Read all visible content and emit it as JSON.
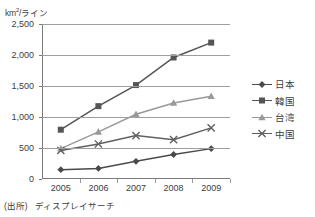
{
  "axis_title": {
    "text": "km2/ライン",
    "unit_base": "km",
    "unit_sup": "2",
    "unit_rest": "/ライン"
  },
  "source_note": {
    "prefix": "(出所)",
    "name": "ディスプレイサーチ"
  },
  "legend": {
    "position": "right",
    "items": [
      {
        "label": "日本",
        "marker": "diamond-marker",
        "color": "#4a4a4a"
      },
      {
        "label": "韓国",
        "marker": "square-marker",
        "color": "#555555"
      },
      {
        "label": "台湾",
        "marker": "triangle-marker",
        "color": "#999999"
      },
      {
        "label": "中国",
        "marker": "x-marker",
        "color": "#606060"
      }
    ]
  },
  "chart_data": {
    "type": "line",
    "title": "",
    "subtitle": "",
    "xlabel": "",
    "ylabel": "km2/ライン",
    "categories": [
      "2005",
      "2006",
      "2007",
      "2008",
      "2009"
    ],
    "x": [
      2005,
      2006,
      2007,
      2008,
      2009
    ],
    "ylim": [
      0,
      2500
    ],
    "yticks": [
      0,
      500,
      1000,
      1500,
      2000,
      2500
    ],
    "ytick_labels": [
      "0",
      "500",
      "1,000",
      "1,500",
      "2,000",
      "2,500"
    ],
    "grid": true,
    "grid_axis": "y",
    "legend_position": "right",
    "series": [
      {
        "name": "日本",
        "marker": "diamond",
        "color": "#4a4a4a",
        "values": [
          150,
          170,
          285,
          395,
          490
        ]
      },
      {
        "name": "韓国",
        "marker": "square",
        "color": "#555555",
        "values": [
          795,
          1175,
          1515,
          1960,
          2200
        ]
      },
      {
        "name": "台湾",
        "marker": "triangle",
        "color": "#999999",
        "values": [
          490,
          760,
          1045,
          1225,
          1335
        ]
      },
      {
        "name": "中国",
        "marker": "x",
        "color": "#606060",
        "values": [
          460,
          565,
          700,
          635,
          825
        ]
      }
    ]
  }
}
